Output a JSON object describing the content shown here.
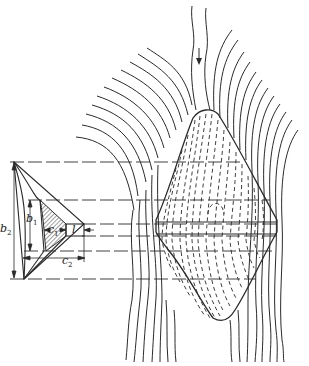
{
  "figure": {
    "labels": {
      "b1": {
        "main": "b",
        "sub": "1"
      },
      "b2": {
        "main": "b",
        "sub": "2"
      },
      "c1": {
        "main": "c",
        "sub": "1"
      },
      "c2": {
        "main": "c",
        "sub": "2"
      },
      "l": {
        "main": "l"
      }
    },
    "flow_arrow": "down",
    "colors": {
      "ink": "#2a2a2a",
      "background": "#ffffff"
    }
  }
}
